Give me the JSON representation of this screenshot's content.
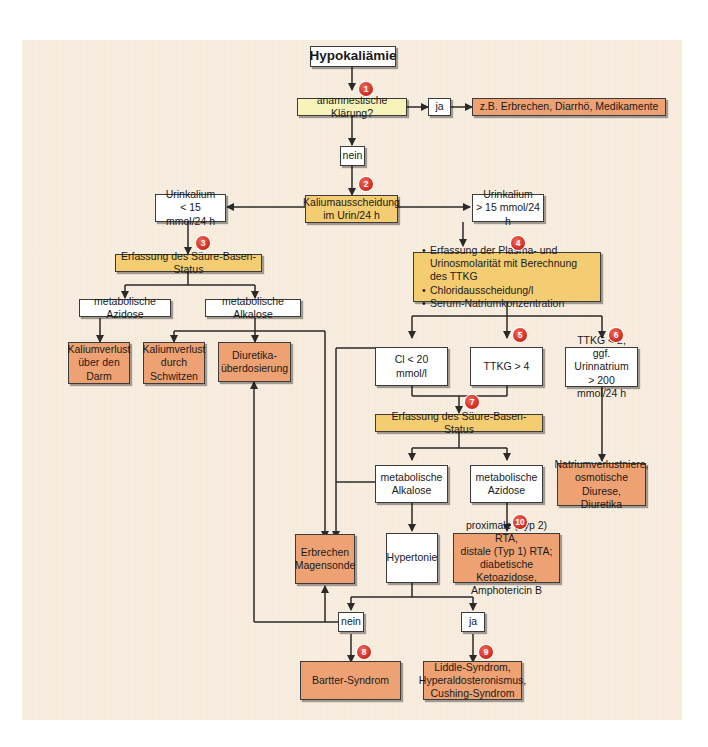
{
  "title": "Hypokaliämie",
  "nodes": {
    "start": "Hypokaliämie",
    "anamnese": "anamnestische Klärung?",
    "anamnese_ja": "ja",
    "anamnese_ja_result": "z.B. Erbrechen, Diarrhö, Medikamente",
    "anamnese_nein": "nein",
    "kaliumausscheidung_l1": "Kaliumausscheidung",
    "kaliumausscheidung_l2": "im Urin/24 h",
    "urin_low_l1": "Urinkalium",
    "urin_low_l2": "< 15 mmol/24 h",
    "urin_high_l1": "Urinkalium",
    "urin_high_l2": "> 15 mmol/24 h",
    "sbs_left": "Erfassung des Säure-Basen-Status",
    "met_azidose_left": "metabolische Azidose",
    "met_alkalose_left": "metabolische Alkalose",
    "darm_l1": "Kaliumverlust",
    "darm_l2": "über den",
    "darm_l3": "Darm",
    "schwitzen_l1": "Kaliumverlust",
    "schwitzen_l2": "durch",
    "schwitzen_l3": "Schwitzen",
    "diuretika_l1": "Diuretika-",
    "diuretika_l2": "überdosierung",
    "erfassung_list": [
      "Erfassung der Plasma- und Urinosmolarität mit Berechnung des TTKG",
      "Chloridausscheidung/l",
      "Serum-Natriumkonzentration"
    ],
    "cl": "Cl < 20 mmol/l",
    "ttkg_gt4": "TTKG > 4",
    "ttkg_lt2_l1": "TTKG < 2,",
    "ttkg_lt2_l2": "ggf. Urinnatrium",
    "ttkg_lt2_l3": "> 200 mmol/24 h",
    "sbs_right": "Erfassung des Säure-Basen-Status",
    "met_alkalose_right_l1": "metabolische",
    "met_alkalose_right_l2": "Alkalose",
    "met_azidose_right_l1": "metabolische",
    "met_azidose_right_l2": "Azidose",
    "natrium_l1": "Natriumverlustniere,",
    "natrium_l2": "osmotische Diurese,",
    "natrium_l3": "Diuretika",
    "erbrechen_l1": "Erbrechen",
    "erbrechen_l2": "Magensonde",
    "hypertonie": "Hypertonie",
    "rta_l1": "proximale (Typ 2) RTA,",
    "rta_l2": "distale (Typ 1) RTA;",
    "rta_l3": "diabetische Ketoazidose,",
    "rta_l4": "Amphotericin B",
    "hyp_nein": "nein",
    "hyp_ja": "ja",
    "bartter": "Bartter-Syndrom",
    "liddle_l1": "Liddle-Syndrom,",
    "liddle_l2": "Hyperaldosteronismus,",
    "liddle_l3": "Cushing-Syndrom"
  },
  "badges": [
    "1",
    "2",
    "3",
    "4",
    "5",
    "6",
    "7",
    "8",
    "9",
    "10"
  ],
  "colors": {
    "background": "#f6eadb",
    "pale_yellow": "#f8f3b9",
    "gold": "#f4cd72",
    "orange": "#eea273",
    "badge_red": "#d1271b",
    "line": "#2a2a2a"
  }
}
